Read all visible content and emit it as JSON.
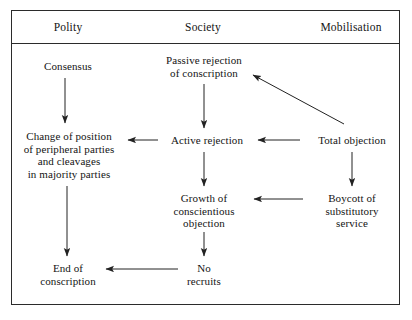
{
  "figure": {
    "columns": [
      {
        "label": "Polity"
      },
      {
        "label": "Society"
      },
      {
        "label": "Mobilisation"
      }
    ],
    "nodes": {
      "consensus": "Consensus",
      "passive_rejection": "Passive rejection\nof conscription",
      "change_position": "Change of position\nof peripheral parties\nand cleavages\nin majority parties",
      "active_rejection": "Active rejection",
      "total_objection": "Total objection",
      "growth_conscientious_objection": "Growth of\nconscientious\nobjection",
      "boycott_substitutory": "Boycott of\nsubstitutory\nservice",
      "end_conscription": "End of\nconscription",
      "no_recruits": "No\nrecruits"
    },
    "edges": [
      {
        "name": "consensus-to-change-position",
        "from": "consensus",
        "to": "change_position",
        "direction": "down"
      },
      {
        "name": "passive-to-active-rejection",
        "from": "passive_rejection",
        "to": "active_rejection",
        "direction": "down"
      },
      {
        "name": "active-rejection-to-change-position",
        "from": "active_rejection",
        "to": "change_position",
        "direction": "left"
      },
      {
        "name": "total-objection-to-active-rejection",
        "from": "total_objection",
        "to": "active_rejection",
        "direction": "left"
      },
      {
        "name": "total-objection-to-passive-rejection",
        "from": "total_objection",
        "to": "passive_rejection",
        "direction": "diagonal-up-left"
      },
      {
        "name": "change-position-to-end-conscription",
        "from": "change_position",
        "to": "end_conscription",
        "direction": "down"
      },
      {
        "name": "active-rejection-to-growth",
        "from": "active_rejection",
        "to": "growth_conscientious_objection",
        "direction": "down"
      },
      {
        "name": "total-objection-to-boycott",
        "from": "total_objection",
        "to": "boycott_substitutory",
        "direction": "down"
      },
      {
        "name": "boycott-to-growth",
        "from": "boycott_substitutory",
        "to": "growth_conscientious_objection",
        "direction": "left"
      },
      {
        "name": "growth-to-no-recruits",
        "from": "growth_conscientious_objection",
        "to": "no_recruits",
        "direction": "down"
      },
      {
        "name": "no-recruits-to-end-conscription",
        "from": "no_recruits",
        "to": "end_conscription",
        "direction": "left"
      }
    ],
    "colors": {
      "ink": "#141414",
      "rule": "#2b2b2b",
      "arrow": "#222222",
      "background": "#ffffff"
    }
  }
}
